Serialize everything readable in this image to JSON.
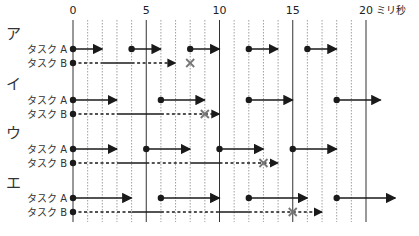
{
  "axis": {
    "unit_label": "ミリ秒",
    "ticks": [
      {
        "value": 0,
        "label": "0"
      },
      {
        "value": 5,
        "label": "5"
      },
      {
        "value": 10,
        "label": "10"
      },
      {
        "value": 15,
        "label": "15"
      },
      {
        "value": 20,
        "label": "20"
      }
    ],
    "min": 0,
    "max": 20,
    "minor_step": 1
  },
  "task_labels": {
    "a": "タスク A",
    "b": "タスク B"
  },
  "sections": [
    {
      "label": "ア",
      "task_a": [
        [
          0,
          2
        ],
        [
          4,
          6
        ],
        [
          8,
          10
        ],
        [
          12,
          14
        ],
        [
          16,
          18
        ]
      ],
      "task_b": {
        "segments": [
          {
            "from": 0,
            "to": 2,
            "style": "dashed"
          },
          {
            "from": 2,
            "to": 4,
            "style": "solid"
          },
          {
            "from": 4,
            "to": 7,
            "style": "dashed"
          }
        ],
        "arrow_end": 7,
        "x_mark": 8
      }
    },
    {
      "label": "イ",
      "task_a": [
        [
          0,
          3
        ],
        [
          6,
          9
        ],
        [
          12,
          15
        ],
        [
          18,
          21
        ]
      ],
      "task_b": {
        "segments": [
          {
            "from": 0,
            "to": 3,
            "style": "dashed"
          },
          {
            "from": 3,
            "to": 6,
            "style": "solid"
          },
          {
            "from": 6,
            "to": 10,
            "style": "dashed"
          }
        ],
        "arrow_end": 10,
        "x_mark": 9
      }
    },
    {
      "label": "ウ",
      "task_a": [
        [
          0,
          3
        ],
        [
          5,
          8
        ],
        [
          10,
          13
        ],
        [
          15,
          18
        ]
      ],
      "task_b": {
        "segments": [
          {
            "from": 0,
            "to": 3,
            "style": "dashed"
          },
          {
            "from": 3,
            "to": 5,
            "style": "solid"
          },
          {
            "from": 5,
            "to": 8,
            "style": "dashed"
          },
          {
            "from": 8,
            "to": 10,
            "style": "solid"
          },
          {
            "from": 10,
            "to": 14,
            "style": "dashed"
          }
        ],
        "arrow_end": 14,
        "x_mark": 13
      }
    },
    {
      "label": "エ",
      "task_a": [
        [
          0,
          4
        ],
        [
          6,
          10
        ],
        [
          12,
          16
        ],
        [
          18,
          22
        ]
      ],
      "task_b": {
        "segments": [
          {
            "from": 0,
            "to": 4,
            "style": "dashed"
          },
          {
            "from": 4,
            "to": 6,
            "style": "solid"
          },
          {
            "from": 6,
            "to": 10,
            "style": "dashed"
          },
          {
            "from": 10,
            "to": 12,
            "style": "solid"
          },
          {
            "from": 12,
            "to": 17,
            "style": "dashed"
          }
        ],
        "arrow_end": 17,
        "x_mark": 15
      }
    }
  ],
  "colors": {
    "line": "#1a1a1a",
    "grid": "#888888",
    "x_mark": "#777777"
  }
}
